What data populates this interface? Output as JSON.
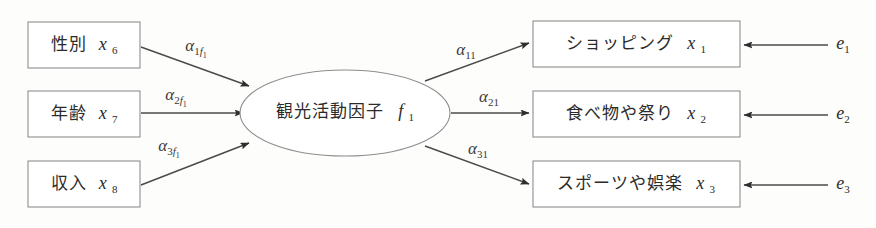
{
  "diagram": {
    "type": "path-diagram",
    "background_color": "#fdfdfc",
    "line_color": "#8e8e8e",
    "arrow_color": "#4a4a4a",
    "text_color": "#2b2b2b"
  },
  "latent_factor": {
    "label": "観光活動因子",
    "symbol": "f",
    "symbol_subscript": "1",
    "shape": "ellipse",
    "center_x": 345,
    "center_y": 113,
    "rx": 105,
    "ry": 43
  },
  "exogenous_boxes": [
    {
      "label": "性別",
      "symbol": "x",
      "symbol_subscript": "6",
      "x": 28,
      "y": 22,
      "width": 112,
      "height": 46
    },
    {
      "label": "年齢",
      "symbol": "x",
      "symbol_subscript": "7",
      "x": 28,
      "y": 91,
      "width": 112,
      "height": 46
    },
    {
      "label": "収入",
      "symbol": "x",
      "symbol_subscript": "8",
      "x": 28,
      "y": 161,
      "width": 112,
      "height": 46
    }
  ],
  "indicator_boxes": [
    {
      "label": "ショッピング",
      "symbol": "x",
      "symbol_subscript": "1",
      "x": 533,
      "y": 21,
      "width": 207,
      "height": 46
    },
    {
      "label": "食べ物や祭り",
      "symbol": "x",
      "symbol_subscript": "2",
      "x": 533,
      "y": 91,
      "width": 207,
      "height": 46
    },
    {
      "label": "スポーツや娯楽",
      "symbol": "x",
      "symbol_subscript": "3",
      "x": 533,
      "y": 161,
      "width": 207,
      "height": 46
    }
  ],
  "left_coefficients": [
    {
      "symbol": "α",
      "sub1": "1",
      "sub2": "f",
      "sub3": "1",
      "x": 196,
      "y": 47
    },
    {
      "symbol": "α",
      "sub1": "2",
      "sub2": "f",
      "sub3": "1",
      "x": 176,
      "y": 96
    },
    {
      "symbol": "α",
      "sub1": "3",
      "sub2": "f",
      "sub3": "1",
      "x": 169,
      "y": 147
    }
  ],
  "right_coefficients": [
    {
      "symbol": "α",
      "sub1": "11",
      "x": 466,
      "y": 51
    },
    {
      "symbol": "α",
      "sub1": "21",
      "x": 489,
      "y": 98
    },
    {
      "symbol": "α",
      "sub1": "31",
      "x": 478,
      "y": 150
    }
  ],
  "error_terms": [
    {
      "symbol": "e",
      "symbol_subscript": "1",
      "x": 843,
      "y": 45
    },
    {
      "symbol": "e",
      "symbol_subscript": "2",
      "x": 843,
      "y": 115
    },
    {
      "symbol": "e",
      "symbol_subscript": "3",
      "x": 843,
      "y": 185
    }
  ]
}
